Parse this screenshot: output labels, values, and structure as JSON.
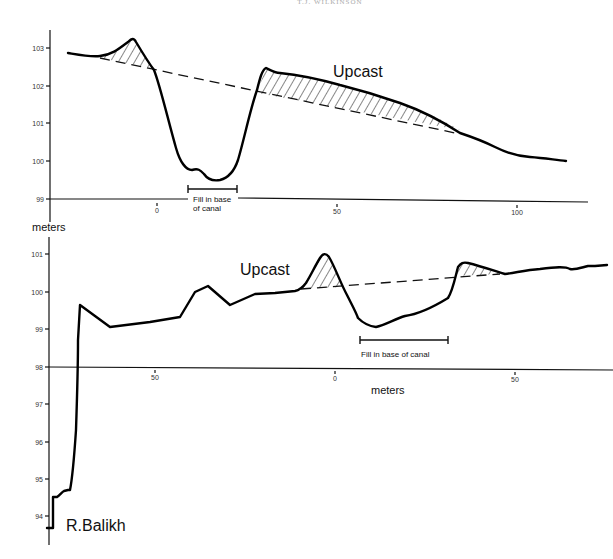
{
  "header": {
    "running_head": "T.J. WILKINSON"
  },
  "top_profile": {
    "y_axis": {
      "ticks": [
        "103",
        "102",
        "101",
        "100",
        "99"
      ],
      "unit_label": "meters"
    },
    "x_axis": {
      "ticks": [
        "0",
        "50",
        "100"
      ]
    },
    "annotations": {
      "upcast": "Upcast",
      "fill_line1": "Fill in base",
      "fill_line2": "of canal"
    }
  },
  "bottom_profile": {
    "y_axis": {
      "ticks": [
        "101",
        "100",
        "99",
        "98",
        "97",
        "96",
        "95",
        "94"
      ]
    },
    "x_axis": {
      "ticks": [
        "50",
        "0",
        "50"
      ],
      "unit_label": "meters"
    },
    "annotations": {
      "upcast": "Upcast",
      "fill": "Fill in base of canal",
      "river": "R.Balikh"
    }
  },
  "colors": {
    "line": "#000000",
    "background": "#ffffff"
  }
}
